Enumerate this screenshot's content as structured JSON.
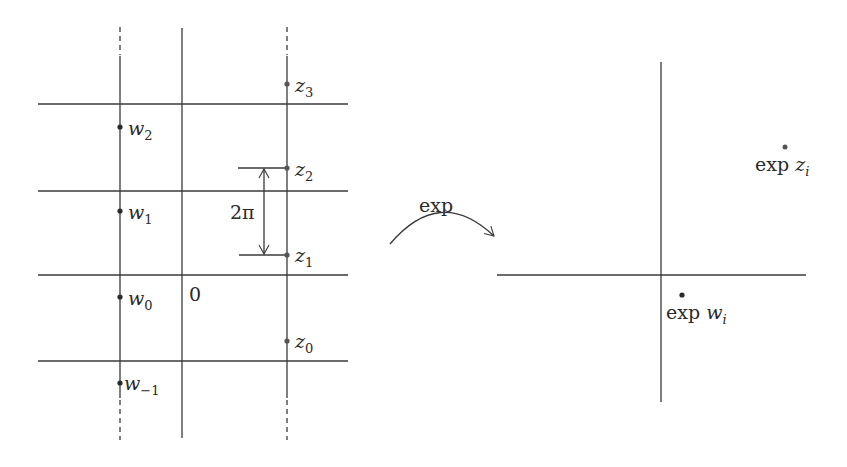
{
  "figure": {
    "colors": {
      "line": "#3a3a3a",
      "dot": "#2a2a2a",
      "text": "#2a2a2a",
      "background": "#ffffff"
    }
  },
  "left_panel": {
    "origin_label": "0",
    "period_label": "2π",
    "w_points": [
      {
        "base": "w",
        "sub": "2"
      },
      {
        "base": "w",
        "sub": "1"
      },
      {
        "base": "w",
        "sub": "0"
      },
      {
        "base": "w",
        "sub": "−1"
      }
    ],
    "z_points": [
      {
        "base": "z",
        "sub": "3"
      },
      {
        "base": "z",
        "sub": "2"
      },
      {
        "base": "z",
        "sub": "1"
      },
      {
        "base": "z",
        "sub": "0"
      }
    ]
  },
  "map_arrow": {
    "label": "exp"
  },
  "right_panel": {
    "points": [
      {
        "prefix": "exp",
        "base": "z",
        "sub": "i"
      },
      {
        "prefix": "exp",
        "base": "w",
        "sub": "i"
      }
    ]
  }
}
